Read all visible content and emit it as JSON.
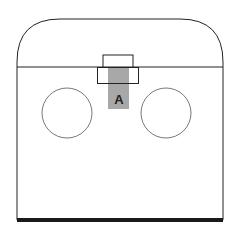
{
  "diagram": {
    "label": "A",
    "colors": {
      "stroke": "#222222",
      "fill": "#ffffff",
      "highlight": "#a8a8a8",
      "base": "#1a1a1a"
    }
  }
}
